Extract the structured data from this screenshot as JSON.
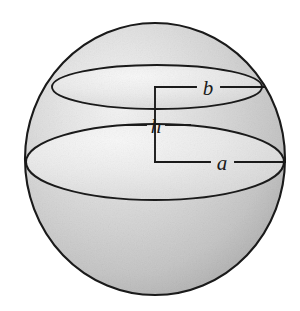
{
  "figure": {
    "kind": "geometry-diagram",
    "background_color": "#ffffff",
    "outline_color": "#1a1a1a",
    "fill_light": "#f2f2f2",
    "fill_mid": "#d2d2d2",
    "fill_dark": "#b4b4b4",
    "labels": {
      "upper_radius": "b",
      "height": "h",
      "lower_radius": "a"
    },
    "sphere": {
      "center_x": 155,
      "center_y": 159,
      "radius_x": 130,
      "radius_y": 136
    },
    "upper_circle": {
      "center_x": 157,
      "center_y": 87,
      "radius_x": 105,
      "radius_y": 22
    },
    "lower_circle": {
      "center_x": 155,
      "center_y": 162,
      "radius_x": 129,
      "radius_y": 38
    },
    "leader": {
      "axis_x": 155,
      "top_y": 87,
      "bottom_y": 162,
      "upper_line_end_x": 265,
      "lower_line_end_x": 285,
      "h_tick_left_x": 126,
      "h_tick_right_x": 186
    }
  }
}
